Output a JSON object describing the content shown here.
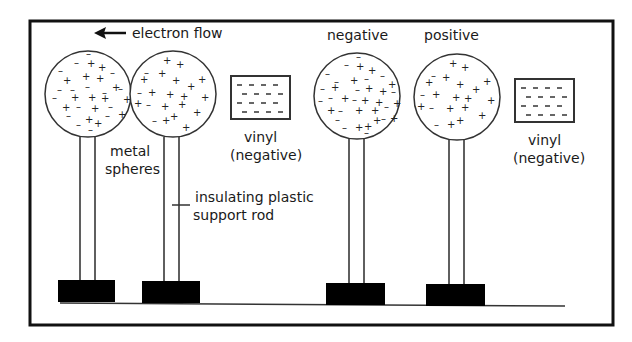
{
  "diagram": {
    "colors": {
      "ink": "#1a1a1a",
      "background": "#ffffff",
      "base": "#000000"
    },
    "left_panel": {
      "arrow_label": "electron flow",
      "arrow_direction": "left",
      "spheres_label_line1": "metal",
      "spheres_label_line2": "spheres",
      "rod_label_line1": "insulating plastic",
      "rod_label_line2": "support rod",
      "vinyl_label_line1": "vinyl",
      "vinyl_label_line2": "(negative)"
    },
    "right_panel": {
      "sphere1_label": "negative",
      "sphere2_label": "positive",
      "vinyl_label_line1": "vinyl",
      "vinyl_label_line2": "(negative)"
    }
  }
}
